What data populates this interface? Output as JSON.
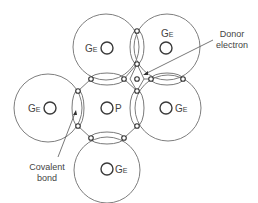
{
  "diagram": {
    "atoms": [
      {
        "id": "ge-top-left",
        "symbol": "G",
        "subscript": "E",
        "cx": 107,
        "cy": 48,
        "r": 33
      },
      {
        "id": "ge-top-right",
        "symbol": "G",
        "subscript": "E",
        "cx": 166,
        "cy": 48,
        "r": 33
      },
      {
        "id": "ge-left",
        "symbol": "G",
        "subscript": "E",
        "cx": 48,
        "cy": 108,
        "r": 34
      },
      {
        "id": "p-center",
        "symbol": "P",
        "subscript": "",
        "cx": 107,
        "cy": 108
      },
      {
        "id": "ge-right",
        "symbol": "G",
        "subscript": "E",
        "cx": 167,
        "cy": 108,
        "r": 33
      },
      {
        "id": "ge-bottom",
        "symbol": "G",
        "subscript": "E",
        "cx": 107,
        "cy": 169,
        "r": 33
      }
    ],
    "labels": {
      "ge_top_left": {
        "main": "G",
        "sub": "E"
      },
      "ge_top_right": {
        "main": "G",
        "sub": "E"
      },
      "ge_left": {
        "main": "G",
        "sub": "E"
      },
      "p_center": {
        "main": "P"
      },
      "ge_right": {
        "main": "G",
        "sub": "E"
      },
      "ge_bottom": {
        "main": "G",
        "sub": "E"
      }
    },
    "annotations": {
      "donor_line1": "Donor",
      "donor_line2": "electron",
      "covalent_line1": "Covalent",
      "covalent_line2": "bond"
    },
    "colors": {
      "stroke": "#6f6f6f",
      "text": "#444444",
      "background": "#ffffff"
    }
  }
}
